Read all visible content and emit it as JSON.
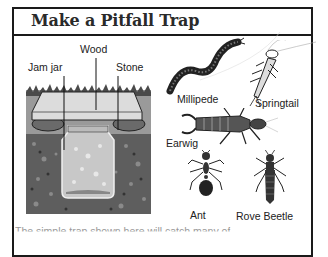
{
  "page": {
    "title": "Make a Pitfall Trap",
    "caption_partial": "The simple trap shown here will catch many                of"
  },
  "trap_diagram": {
    "labels": {
      "wood": "Wood",
      "jam_jar": "Jam jar",
      "stone": "Stone"
    }
  },
  "creatures": [
    {
      "name": "Millipede"
    },
    {
      "name": "Springtail"
    },
    {
      "name": "Earwig"
    },
    {
      "name": "Ant"
    },
    {
      "name": "Rove Beetle"
    }
  ],
  "colors": {
    "border": "#1a1a1a",
    "soil": "#555555",
    "wood": "#d8d8d8"
  }
}
